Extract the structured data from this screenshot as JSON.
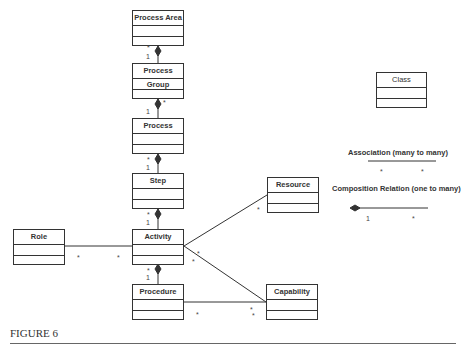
{
  "diagram": {
    "classes": [
      {
        "id": "process_area",
        "label": "Process Area"
      },
      {
        "id": "process_group",
        "label": "Process Group"
      },
      {
        "id": "process",
        "label": "Process"
      },
      {
        "id": "step",
        "label": "Step"
      },
      {
        "id": "activity",
        "label": "Activity"
      },
      {
        "id": "procedure",
        "label": "Procedure"
      },
      {
        "id": "role",
        "label": "Role"
      },
      {
        "id": "resource",
        "label": "Resource"
      },
      {
        "id": "capability",
        "label": "Capability"
      }
    ],
    "relations": [
      {
        "from": "process_area",
        "to": "process_group",
        "type": "composition",
        "whole": "1",
        "part": "*"
      },
      {
        "from": "process_group",
        "to": "process",
        "type": "composition",
        "whole": "1",
        "part": "*"
      },
      {
        "from": "process",
        "to": "step",
        "type": "composition",
        "whole": "1",
        "part": "*"
      },
      {
        "from": "step",
        "to": "activity",
        "type": "composition",
        "whole": "1",
        "part": "*"
      },
      {
        "from": "activity",
        "to": "procedure",
        "type": "composition",
        "whole": "1",
        "part": "*"
      },
      {
        "from": "role",
        "to": "activity",
        "type": "association",
        "mult_a": "*",
        "mult_b": "*"
      },
      {
        "from": "activity",
        "to": "resource",
        "type": "association",
        "mult_a": "*",
        "mult_b": "*"
      },
      {
        "from": "activity",
        "to": "capability",
        "type": "association",
        "mult_a": "*",
        "mult_b": "*"
      },
      {
        "from": "procedure",
        "to": "capability",
        "type": "association",
        "mult_a": "*",
        "mult_b": "*"
      }
    ]
  },
  "legend": {
    "class_label": "Class",
    "association_label": "Association (many to many)",
    "association_mult_a": "*",
    "association_mult_b": "*",
    "composition_label": "Composition Relation (one to many)",
    "composition_mult_a": "1",
    "composition_mult_b": "*"
  },
  "mult": {
    "one": "1",
    "many": "*"
  },
  "caption": "FIGURE 6"
}
